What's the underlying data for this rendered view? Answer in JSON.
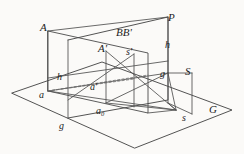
{
  "figure": {
    "kind": "perspective-projection-diagram",
    "background_color": "#fbfaf8",
    "stroke_color": "#4a4a4a",
    "label_color": "#1c1c1c",
    "width": 244,
    "height": 154,
    "labels": [
      {
        "id": "A",
        "text": "A",
        "x": 40,
        "y": 22,
        "size": "upper"
      },
      {
        "id": "P",
        "text": "P",
        "x": 168,
        "y": 12,
        "size": "upper"
      },
      {
        "id": "BB",
        "text": "BB'",
        "x": 118,
        "y": 28,
        "size": "upper"
      },
      {
        "id": "h-right",
        "text": "h",
        "x": 164,
        "y": 40,
        "size": "lower"
      },
      {
        "id": "A-prime",
        "text": "A'",
        "x": 99,
        "y": 43,
        "size": "upper"
      },
      {
        "id": "s-prime",
        "text": "s'",
        "x": 126,
        "y": 47,
        "size": "lower"
      },
      {
        "id": "g-upper",
        "text": "g",
        "x": 162,
        "y": 71,
        "size": "lower"
      },
      {
        "id": "S",
        "text": "S",
        "x": 186,
        "y": 69,
        "size": "upper"
      },
      {
        "id": "h-left",
        "text": "h",
        "x": 57,
        "y": 73,
        "size": "lower"
      },
      {
        "id": "a-prime",
        "text": "a'",
        "x": 91,
        "y": 83,
        "size": "lower"
      },
      {
        "id": "a",
        "text": "a",
        "x": 40,
        "y": 91,
        "size": "lower"
      },
      {
        "id": "G",
        "text": "G",
        "x": 210,
        "y": 106,
        "size": "upper"
      },
      {
        "id": "a-zero",
        "text": "a",
        "sub": "0",
        "x": 96,
        "y": 107,
        "size": "lower"
      },
      {
        "id": "s",
        "text": "s",
        "x": 182,
        "y": 114,
        "size": "lower"
      },
      {
        "id": "g-lower",
        "text": "g",
        "x": 60,
        "y": 122,
        "size": "lower"
      }
    ],
    "geometry": {
      "ground_plane": {
        "name": "ground-plane-G",
        "points": "12,93 102,62 232,110 135,148"
      },
      "picture_plane": {
        "name": "picture-plane-P",
        "points": "68,40 168,17 168,77 68,100"
      },
      "object_plane": {
        "name": "object-plane-A",
        "points": "48,31 148,53 148,113 48,91"
      },
      "horizon_line": {
        "name": "horizon-line-h",
        "from": "48,31",
        "to": "168,17"
      },
      "lines": [
        {
          "name": "vertical-edge-left-picture",
          "x1": 68,
          "y1": 40,
          "x2": 68,
          "y2": 118
        },
        {
          "name": "vertical-edge-right-picture",
          "x1": 168,
          "y1": 17,
          "x2": 168,
          "y2": 100
        },
        {
          "name": "vertical-edge-A",
          "x1": 48,
          "y1": 31,
          "x2": 48,
          "y2": 91
        },
        {
          "name": "vertical-edge-A-prime",
          "x1": 106,
          "y1": 51,
          "x2": 106,
          "y2": 103
        },
        {
          "name": "vertical-edge-s-prime",
          "x1": 134,
          "y1": 54,
          "x2": 134,
          "y2": 107
        },
        {
          "name": "vertical-edge-S",
          "x1": 192,
          "y1": 73,
          "x2": 192,
          "y2": 114
        },
        {
          "name": "station-square-top",
          "x1": 168,
          "y1": 73,
          "x2": 192,
          "y2": 73
        },
        {
          "name": "station-square-bottom",
          "x1": 168,
          "y1": 103,
          "x2": 192,
          "y2": 114
        },
        {
          "name": "ground-line-left-h",
          "x1": 48,
          "y1": 78,
          "x2": 168,
          "y2": 61
        },
        {
          "name": "ground-line-g-left",
          "x1": 48,
          "y1": 91,
          "x2": 168,
          "y2": 73
        },
        {
          "name": "ray-a-to-s",
          "x1": 48,
          "y1": 91,
          "x2": 176,
          "y2": 110
        },
        {
          "name": "ray-a-to-a-prime",
          "x1": 48,
          "y1": 91,
          "x2": 134,
          "y2": 79
        },
        {
          "name": "ray-a0-to-s",
          "x1": 106,
          "y1": 103,
          "x2": 176,
          "y2": 110
        },
        {
          "name": "ray-A-top-to-P",
          "x1": 48,
          "y1": 31,
          "x2": 168,
          "y2": 17
        },
        {
          "name": "base-line-object-plane",
          "x1": 48,
          "y1": 91,
          "x2": 148,
          "y2": 113
        },
        {
          "name": "base-line-object-top",
          "x1": 48,
          "y1": 31,
          "x2": 148,
          "y2": 53
        },
        {
          "name": "right-edge-object-plane",
          "x1": 148,
          "y1": 53,
          "x2": 148,
          "y2": 113
        },
        {
          "name": "ray-Aprime-to-s",
          "x1": 106,
          "y1": 51,
          "x2": 176,
          "y2": 110
        },
        {
          "name": "ray-a0-up",
          "x1": 106,
          "y1": 103,
          "x2": 168,
          "y2": 73
        },
        {
          "name": "ray-sprime-down-left",
          "x1": 134,
          "y1": 54,
          "x2": 68,
          "y2": 100
        },
        {
          "name": "connector-g-to-s",
          "x1": 168,
          "y1": 73,
          "x2": 176,
          "y2": 110
        }
      ]
    }
  }
}
